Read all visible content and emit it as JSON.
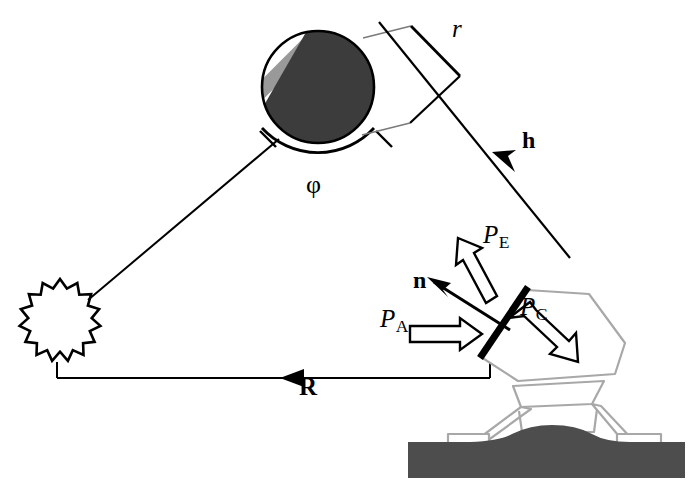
{
  "figure": {
    "type": "scientific-diagram",
    "background_color": "#ffffff",
    "ink_color": "#000000",
    "terrain_color": "#4d4d4d",
    "spacecraft_outline_color": "#a8a8a8",
    "planet_dark_color": "#3c3c3c",
    "planet_stripe_color": "#999999"
  },
  "labels": {
    "r": {
      "text": "r",
      "style": "italic",
      "x": 452,
      "y": 22
    },
    "h": {
      "text": "h",
      "style": "bold",
      "x": 523,
      "y": 134
    },
    "phi": {
      "text": "φ",
      "style": "upright",
      "x": 308,
      "y": 176
    },
    "R": {
      "text": "R",
      "style": "bold",
      "x": 300,
      "y": 381
    },
    "n": {
      "text": "n",
      "style": "bold",
      "x": 414,
      "y": 274
    },
    "P_E": {
      "base": "P",
      "sub": "E",
      "style": "italic",
      "x": 484,
      "y": 228
    },
    "P_A": {
      "base": "P",
      "sub": "A",
      "style": "italic",
      "x": 381,
      "y": 312
    },
    "P_C": {
      "base": "P",
      "sub": "C",
      "style": "italic",
      "x": 521,
      "y": 300
    }
  },
  "elements": {
    "sun": {
      "name": "sun-starburst",
      "cx": 60,
      "cy": 315,
      "points": 16,
      "r_outer": 36,
      "r_inner": 27
    },
    "planet": {
      "name": "striped-planet",
      "cx": 318,
      "cy": 87,
      "r": 57,
      "stripe_count": 4,
      "terminator_angle_deg": 62
    },
    "phi_arc": {
      "name": "phi-angle-arc",
      "cx": 318,
      "cy": 87,
      "r": 76
    },
    "r_bracket": {
      "name": "r-dimension-bracket"
    },
    "h_vector": {
      "name": "h-vector-line",
      "from_x": 570,
      "from_y": 258,
      "to_x": 376,
      "to_y": 18
    },
    "R_vector": {
      "name": "R-vector-line",
      "from_x": 490,
      "from_y": 378,
      "to_x": 57,
      "to_y": 378
    },
    "sun_planet_line": {
      "name": "sun-to-planet-line",
      "from_x": 88,
      "from_y": 300,
      "to_x": 278,
      "to_y": 140
    },
    "sail_plane": {
      "name": "solar-sail-plane-thick-line",
      "from_x": 527,
      "from_y": 288,
      "to_x": 481,
      "to_y": 357
    },
    "spacecraft_body": {
      "name": "spacecraft-body-hexagon"
    },
    "landing_legs": {
      "name": "landing-legs"
    },
    "terrain": {
      "name": "planet-surface-terrain"
    }
  }
}
